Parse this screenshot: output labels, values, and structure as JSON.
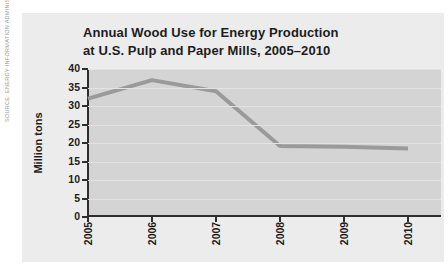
{
  "source_note": "SOURCE: ENERGY INFORMATION ADMINISTRATION",
  "chart_data": {
    "type": "line",
    "title": "Annual Wood Use for Energy Production at U.S. Pulp and Paper Mills, 2005–2010",
    "title_lines": [
      "Annual Wood Use for Energy Production",
      "at U.S. Pulp and Paper Mills, 2005–2010"
    ],
    "ylabel": "Million tons",
    "xlabel": "",
    "categories": [
      "2005",
      "2006",
      "2007",
      "2008",
      "2009",
      "2010"
    ],
    "series": [
      {
        "name": "Wood use (million tons)",
        "values": [
          32,
          37,
          34,
          19.2,
          19,
          18.5
        ]
      }
    ],
    "ylim": [
      0,
      40
    ],
    "yticks": [
      0,
      5,
      10,
      15,
      20,
      25,
      30,
      35,
      40
    ],
    "grid": true,
    "legend_position": "none",
    "colors": {
      "line": "#9a9a9a",
      "plot_bg": "#d4d4d4",
      "figure_bg": "#ececec",
      "gridline": "#e3e3e3",
      "axis": "#2e2e2e",
      "text": "#1d1d1d",
      "source_text": "#999999"
    }
  }
}
